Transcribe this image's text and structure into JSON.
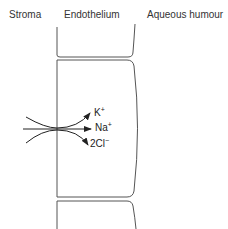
{
  "headers": {
    "stroma": "Stroma",
    "endothelium": "Endothelium",
    "aqueous": "Aqueous humour"
  },
  "ions": [
    {
      "symbol": "K",
      "charge": "+",
      "direction": "into cell (curving up)"
    },
    {
      "symbol": "Na",
      "charge": "+",
      "direction": "into cell (straight)"
    },
    {
      "symbol": "2Cl",
      "charge": "−",
      "direction": "into cell (curving down)"
    }
  ],
  "colors": {
    "outline": "#555555",
    "arrow": "#222222",
    "text": "#222222"
  }
}
